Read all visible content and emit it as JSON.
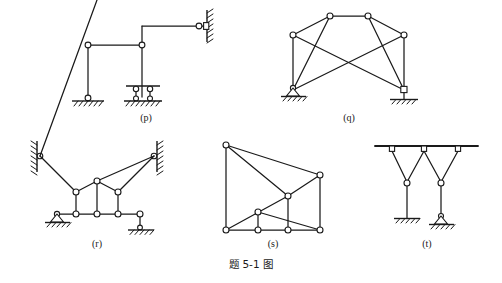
{
  "figure": {
    "caption": "题 5-1 图",
    "caption_parts": {
      "prefix": "题",
      "number": "5-1",
      "suffix": "图"
    },
    "background_color": "#ffffff",
    "line_color": "#1a1a1a",
    "node_fill": "#ffffff"
  },
  "panels": [
    {
      "id": "p",
      "label": "(p)",
      "title": "frame-with-offset-beams",
      "description": "Stepped rigid frame: left column on pin support, vertical column on double-link roller support, upper beam reaching wall hinge at right.",
      "supports": [
        "pin-on-ground",
        "double-link-roller-on-ground",
        "wall-hinge"
      ],
      "hinge_count": 5
    },
    {
      "id": "q",
      "label": "(q)",
      "title": "x-braced-trapezoidal-truss",
      "description": "Trapezoidal truss with two top chord nodes, two eave nodes, crossing diagonals to both base supports.",
      "supports": [
        "pin-on-ground",
        "hinge-on-ground"
      ],
      "hinge_count": 6
    },
    {
      "id": "r",
      "label": "(r)",
      "title": "cable-stayed-two-wall-truss",
      "description": "Symmetric stayed frame anchored to two walls, apex node, two hangers, horizontal bottom chord on pin and roller supports.",
      "supports": [
        "wall-hinge-left",
        "wall-hinge-right",
        "pin-on-ground",
        "roller-on-ground"
      ],
      "hinge_count": 10
    },
    {
      "id": "s",
      "label": "(s)",
      "title": "rectangular-panel-truss",
      "description": "Rectangular truss with four bottom nodes, right chord node, top-left node and internal diagonals forming triangular panels.",
      "supports": [],
      "hinge_count": 8
    },
    {
      "id": "t",
      "label": "(t)",
      "title": "twin-v-hangers-from-ceiling",
      "description": "Two V-shaped hanger assemblies suspended from a ceiling beam; left leg fixed to ground, right leg on pin support.",
      "supports": [
        "ceiling-beam",
        "fixed-on-ground",
        "pin-on-ground"
      ],
      "hinge_count": 5
    }
  ]
}
